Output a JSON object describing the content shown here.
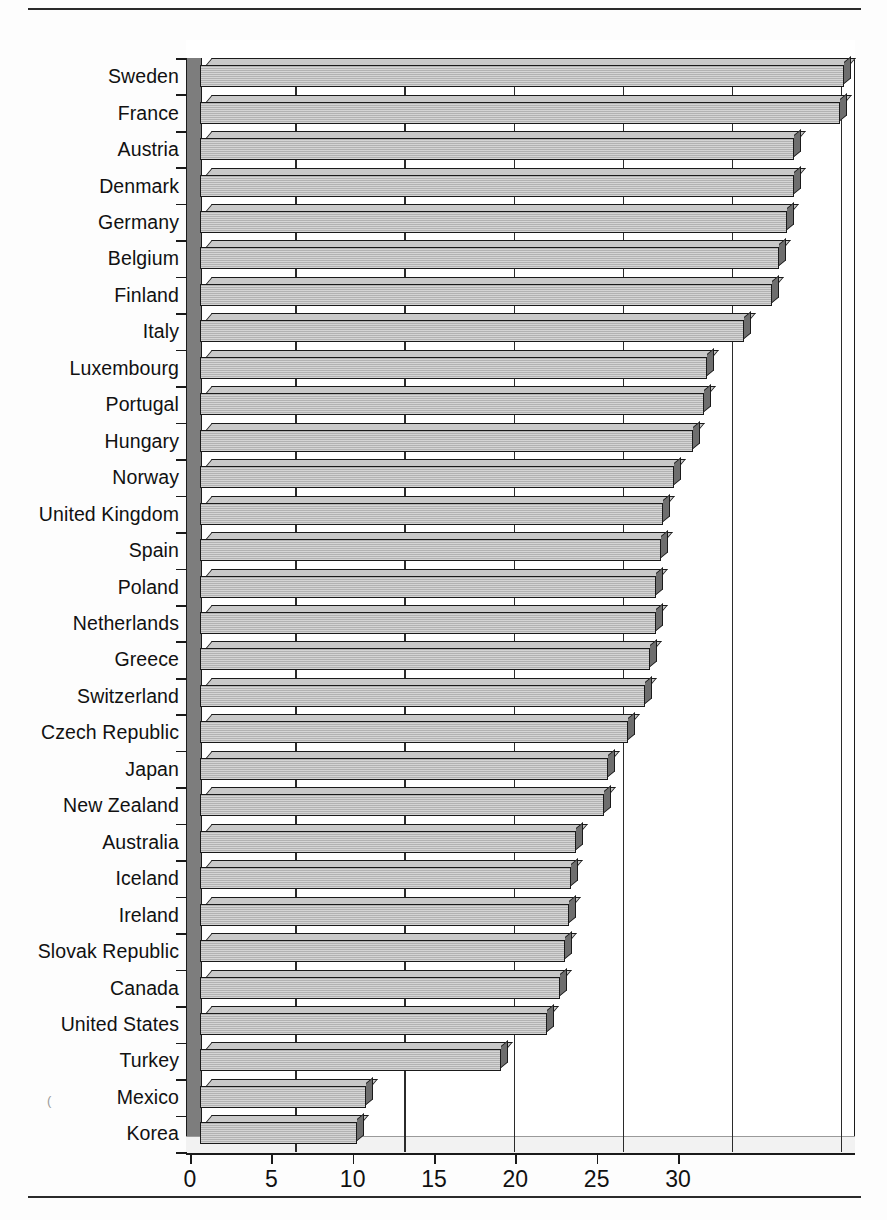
{
  "chart_data": {
    "type": "bar",
    "orientation": "horizontal",
    "title": "",
    "subtitle": "",
    "xlabel": "",
    "ylabel": "",
    "xlim": [
      0,
      30
    ],
    "ylim": null,
    "grid": true,
    "legend": null,
    "style": "3d-extruded-bars",
    "xticks": [
      0,
      5,
      10,
      15,
      20,
      25,
      30
    ],
    "xtick_labels": [
      "0",
      "5",
      "10",
      "15",
      "20",
      "25",
      "30"
    ],
    "categories": [
      "Sweden",
      "France",
      "Austria",
      "Denmark",
      "Germany",
      "Belgium",
      "Finland",
      "Italy",
      "Luxembourg",
      "Portugal",
      "Hungary",
      "Norway",
      "United Kingdom",
      "Spain",
      "Poland",
      "Netherlands",
      "Greece",
      "Switzerland",
      "Czech Republic",
      "Japan",
      "New Zealand",
      "Australia",
      "Iceland",
      "Ireland",
      "Slovak Republic",
      "Canada",
      "United States",
      "Turkey",
      "Mexico",
      "Korea"
    ],
    "values": [
      29.5,
      29.3,
      27.2,
      27.2,
      26.9,
      26.5,
      26.2,
      24.9,
      23.2,
      23.1,
      22.6,
      21.7,
      21.2,
      21.1,
      20.9,
      20.9,
      20.6,
      20.4,
      19.6,
      18.7,
      18.5,
      17.2,
      17.0,
      16.9,
      16.7,
      16.5,
      15.9,
      13.8,
      7.6,
      7.2
    ],
    "colors": {
      "bar_face": "#b2b2b2",
      "bar_top": "#c9c9c9",
      "bar_side": "#6e6e6e",
      "outline": "#1a1a1a",
      "plot_background": "#ffffff",
      "axis": "#1a1a1a"
    }
  },
  "page": {
    "stray_mark": "("
  }
}
